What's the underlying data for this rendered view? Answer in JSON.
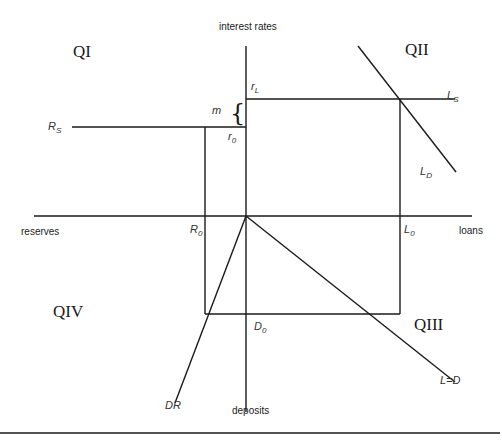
{
  "axes": {
    "vertical_top": "interest rates",
    "vertical_bottom": "deposits",
    "horizontal_left": "reserves",
    "horizontal_right": "loans"
  },
  "quadrants": {
    "q1": "QI",
    "q2": "QII",
    "q3": "QIII",
    "q4": "QIV"
  },
  "labels": {
    "rs_main": "R",
    "rs_sub": "S",
    "ls_main": "L",
    "ls_sub": "S",
    "ld_main": "L",
    "ld_sub": "D",
    "rl_main": "r",
    "rl_sub": "L",
    "r0_main": "r",
    "r0_sub": "0",
    "m": "m",
    "brace": "{",
    "R0_main": "R",
    "R0_sub": "0",
    "L0_main": "L",
    "L0_sub": "0",
    "D0_main": "D",
    "D0_sub": "0",
    "dr": "DR",
    "ld_line": "L=D"
  },
  "colors": {
    "line": "#1a1a1a",
    "background": "#ffffff"
  }
}
